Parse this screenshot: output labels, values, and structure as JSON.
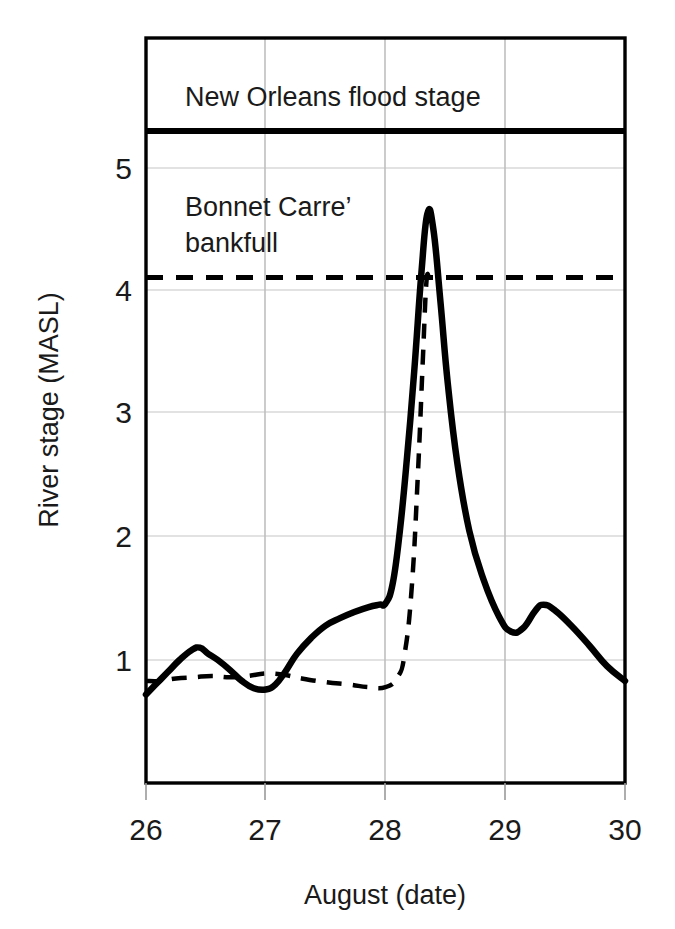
{
  "chart_data": {
    "type": "line",
    "title": "",
    "xlabel": "August (date)",
    "ylabel": "River stage (MASL)",
    "xlim": [
      26,
      30
    ],
    "ylim": [
      0,
      5.8
    ],
    "xticks": [
      26,
      27,
      28,
      29,
      30
    ],
    "xtick_labels": [
      "26",
      "27",
      "28",
      "29",
      "30"
    ],
    "yticks": [
      1,
      2,
      3,
      4,
      5
    ],
    "ytick_labels": [
      "1",
      "2",
      "3",
      "4",
      "5"
    ],
    "grid": true,
    "legend_position": "inline-annotations",
    "annotations": [
      {
        "name": "new-orleans-flood-stage",
        "text": "New Orleans flood stage",
        "value": 5.3,
        "style": "solid-thick",
        "text_x": 26.3,
        "text_y": 5.58
      },
      {
        "name": "bonnet-carre-bankfull",
        "text_line1": "Bonnet Carre’",
        "text_line2": "bankfull",
        "value": 4.11,
        "style": "dashed",
        "text_x": 26.3,
        "text_y": 4.7
      }
    ],
    "series": [
      {
        "name": "river-stage-solid",
        "style": "solid",
        "x": [
          26.0,
          26.08,
          26.18,
          26.28,
          26.38,
          26.45,
          26.52,
          26.6,
          26.7,
          26.8,
          26.9,
          27.0,
          27.08,
          27.16,
          27.26,
          27.38,
          27.5,
          27.62,
          27.74,
          27.86,
          27.95,
          28.0,
          28.06,
          28.12,
          28.18,
          28.24,
          28.3,
          28.35,
          28.4,
          28.46,
          28.52,
          28.6,
          28.7,
          28.82,
          28.95,
          29.05,
          29.15,
          29.25,
          29.32,
          29.42,
          29.55,
          29.7,
          29.85,
          30.0
        ],
        "y": [
          0.72,
          0.8,
          0.9,
          1.0,
          1.08,
          1.1,
          1.05,
          1.0,
          0.92,
          0.83,
          0.77,
          0.76,
          0.8,
          0.9,
          1.05,
          1.18,
          1.28,
          1.34,
          1.39,
          1.43,
          1.45,
          1.46,
          1.62,
          2.05,
          2.65,
          3.35,
          4.15,
          4.63,
          4.5,
          3.9,
          3.25,
          2.6,
          2.05,
          1.65,
          1.35,
          1.23,
          1.26,
          1.4,
          1.45,
          1.4,
          1.28,
          1.12,
          0.95,
          0.83
        ]
      },
      {
        "name": "river-stage-dashed",
        "style": "dashed",
        "x": [
          26.0,
          26.12,
          26.25,
          26.4,
          26.55,
          26.7,
          26.85,
          27.0,
          27.15,
          27.3,
          27.5,
          27.7,
          27.85,
          28.0,
          28.1,
          28.16,
          28.22,
          28.27,
          28.31,
          28.34,
          28.36
        ],
        "y": [
          0.83,
          0.83,
          0.85,
          0.86,
          0.87,
          0.86,
          0.87,
          0.89,
          0.88,
          0.85,
          0.82,
          0.8,
          0.78,
          0.78,
          0.86,
          1.05,
          1.6,
          2.5,
          3.4,
          4.05,
          4.12
        ]
      }
    ]
  },
  "plot": {
    "background": "#ffffff",
    "frame_color": "#000000",
    "grid_color": "#d9d9d9",
    "line_color": "#000000"
  },
  "caption": {
    "partial_text": ""
  }
}
